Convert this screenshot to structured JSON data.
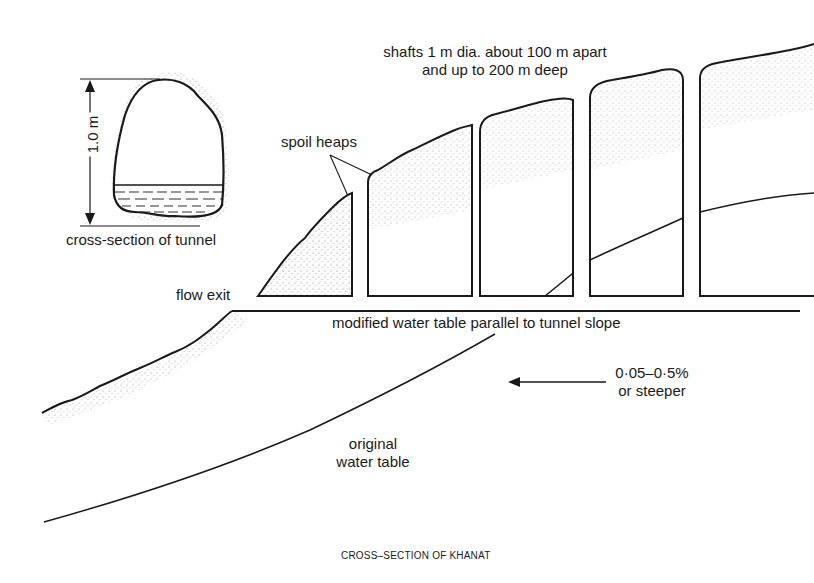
{
  "figure": {
    "caption": "CROSS–SECTION OF KHANAT",
    "colors": {
      "ink": "#1a1a1a",
      "background": "#ffffff",
      "stipple": "#555555"
    }
  },
  "labels": {
    "shafts_line1": "shafts 1 m dia. about 100 m apart",
    "shafts_line2": "and up to 200 m deep",
    "spoil_heaps": "spoil heaps",
    "flow_exit": "flow exit",
    "modified_water_table": "modified water table parallel to tunnel slope",
    "slope_line1": "0·05–0·5%",
    "slope_line2": "or steeper",
    "original_line1": "original",
    "original_line2": "water table",
    "tunnel_cross_section": "cross-section of tunnel",
    "tunnel_height": "1.0 m"
  },
  "shafts": [
    {
      "name": "shaft-1",
      "x_left": 368,
      "x_right": 418
    },
    {
      "name": "shaft-2",
      "x_left": 480,
      "x_right": 573
    },
    {
      "name": "shaft-3",
      "x_left": 590,
      "x_right": 683
    },
    {
      "name": "shaft-4",
      "x_left": 700,
      "x_right": 814
    }
  ]
}
